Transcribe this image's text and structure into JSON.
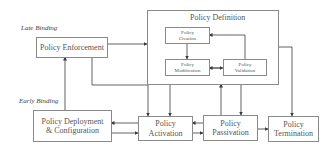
{
  "diagram": {
    "labels": {
      "late_binding": "Late Binding",
      "early_binding": "Early Binding"
    },
    "nodes": {
      "enforcement": "Policy Enforcement",
      "definition_group": "Policy Definition",
      "creation_line1": "Policy",
      "creation_line2": "Creation",
      "modification_line1": "Policy",
      "modification_line2": "Modification",
      "validation_line1": "Policy",
      "validation_line2": "Validation",
      "deployment_line1": "Policy Deployment",
      "deployment_line2": "& Configuration",
      "activation_line1": "Policy",
      "activation_line2": "Activation",
      "passivation_line1": "Policy",
      "passivation_line2": "Passivation",
      "termination_line1": "Policy",
      "termination_line2": "Termination"
    },
    "edges": [
      {
        "from": "Policy Enforcement",
        "to": "Policy Definition"
      },
      {
        "from": "Policy Creation",
        "to": "Policy Modification"
      },
      {
        "from": "Policy Modification",
        "to": "Policy Validation",
        "bidirectional": true
      },
      {
        "from": "Policy Validation",
        "to": "Policy Creation"
      },
      {
        "from": "Policy Deployment & Configuration",
        "to": "Policy Enforcement"
      },
      {
        "from": "Policy Enforcement",
        "to": "Policy Activation"
      },
      {
        "from": "Policy Definition",
        "to": "Policy Activation"
      },
      {
        "from": "Policy Definition",
        "to": "Policy Passivation"
      },
      {
        "from": "Policy Passivation",
        "to": "Policy Definition"
      },
      {
        "from": "Policy Definition",
        "to": "Policy Termination"
      },
      {
        "from": "Policy Activation",
        "to": "Policy Deployment & Configuration"
      },
      {
        "from": "Policy Deployment & Configuration",
        "to": "Policy Activation"
      },
      {
        "from": "Policy Passivation",
        "to": "Policy Activation"
      },
      {
        "from": "Policy Activation",
        "to": "Policy Passivation"
      },
      {
        "from": "Policy Passivation",
        "to": "Policy Termination"
      }
    ],
    "colors": {
      "line": "#3a3a3a",
      "box_border": "#8a8a8a",
      "text": "#555555"
    }
  }
}
